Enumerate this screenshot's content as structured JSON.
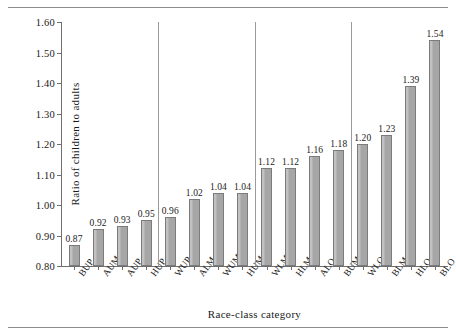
{
  "chart_data": {
    "type": "bar",
    "title": "",
    "xlabel": "Race-class category",
    "ylabel": "Ratio of children to adults",
    "ylim": [
      0.8,
      1.6
    ],
    "ytick_labels": [
      "0.80",
      "0.90",
      "1.00",
      "1.10",
      "1.20",
      "1.30",
      "1.40",
      "1.50",
      "1.60"
    ],
    "ytick_values": [
      0.8,
      0.9,
      1.0,
      1.1,
      1.2,
      1.3,
      1.4,
      1.5,
      1.6
    ],
    "grid": false,
    "legend": "none",
    "bar_color": "#a6a6a6",
    "bar_edge_color": "#7b7b7b",
    "separator_color": "#9a9a9a",
    "axis_color": "#6f6f6f",
    "categories": [
      "BUP",
      "AUM",
      "AUP",
      "HUP",
      "WUP",
      "ALM",
      "WUM",
      "HUM",
      "WLM",
      "HLM",
      "ALO",
      "BUM",
      "WLO",
      "BLM",
      "HLO",
      "BLO"
    ],
    "values": [
      0.87,
      0.92,
      0.93,
      0.95,
      0.96,
      1.02,
      1.04,
      1.04,
      1.12,
      1.12,
      1.16,
      1.18,
      1.2,
      1.23,
      1.39,
      1.54
    ],
    "value_labels": [
      "0.87",
      "0.92",
      "0.93",
      "0.95",
      "0.96",
      "1.02",
      "1.04",
      "1.04",
      "1.12",
      "1.12",
      "1.16",
      "1.18",
      "1.20",
      "1.23",
      "1.39",
      "1.54"
    ],
    "group_separators_after": [
      4,
      8,
      12
    ]
  }
}
